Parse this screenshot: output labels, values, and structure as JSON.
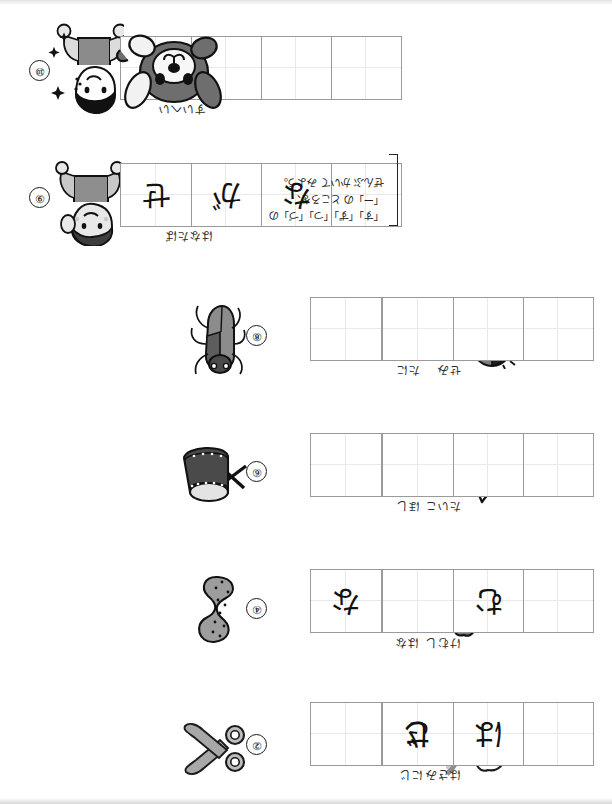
{
  "worksheet": {
    "orientation": "rotated-180",
    "note": {
      "line1": "「す」「ず」「つ」「づ」の",
      "line2": "「ー」の ところを、",
      "line3": "ぜんぶ かいて みよう。"
    },
    "colors": {
      "grid_border": "#9a9a9a",
      "grid_guide": "#e9e9e9",
      "ink": "#111111",
      "art_gray": "#8a8a8a",
      "art_dark": "#3b3b3b"
    }
  },
  "items": [
    {
      "number": "①",
      "label": "にじ",
      "picture": "rainbow-cloud-icon",
      "cells": 2,
      "answers": [
        "じ",
        ""
      ]
    },
    {
      "number": "②",
      "label": "はさみ",
      "picture": "scissors-icon",
      "cells": 3,
      "answers": [
        "",
        "は",
        "さ"
      ]
    },
    {
      "number": "③",
      "label": "はな",
      "picture": "flower-icon",
      "cells": 2,
      "answers": [
        "",
        "な"
      ]
    },
    {
      "number": "④",
      "label": "けむし",
      "picture": "caterpillar-icon",
      "cells": 3,
      "answers": [
        "",
        "む",
        ""
      ]
    },
    {
      "number": "⑤",
      "label": "ほし",
      "picture": "star-icon",
      "cells": 2,
      "answers": [
        "",
        ""
      ]
    },
    {
      "number": "⑥",
      "label": "たいこ",
      "picture": "drum-icon",
      "cells": 3,
      "answers": [
        "",
        "",
        ""
      ]
    },
    {
      "number": "⑦",
      "label": "たに",
      "picture": "acorn-icon",
      "cells": 2,
      "answers": [
        "",
        ""
      ]
    },
    {
      "number": "⑧",
      "label": "せみ",
      "picture": "cicada-icon",
      "cells": 3,
      "answers": [
        "",
        "",
        ""
      ]
    },
    {
      "number": "⑨",
      "label": "はなたば",
      "picture": "girl-icon",
      "cells": 4,
      "answers": [
        "",
        "な",
        "が",
        "せ"
      ]
    },
    {
      "number": "⑩",
      "label": "すいへい",
      "picture": "sailor-boy-icon",
      "cells": 4,
      "answers": [
        "",
        "",
        "",
        ""
      ]
    }
  ],
  "decoration": {
    "dog_picture": "dog-icon"
  }
}
